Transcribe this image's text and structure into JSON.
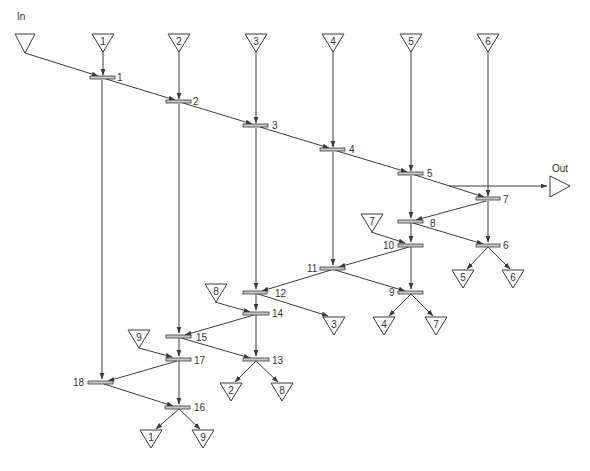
{
  "diagram": {
    "type": "sorting-network-flow",
    "input_label": "In",
    "output_label": "Out",
    "colors": {
      "line": "#3a3a3a",
      "bar_fill": "#c8c8c8",
      "background": "#ffffff"
    },
    "top_inputs": [
      {
        "id": "in",
        "label": "",
        "x": 23,
        "y": 34
      },
      {
        "id": "t1",
        "label": "1",
        "x": 103,
        "y": 34
      },
      {
        "id": "t2",
        "label": "2",
        "x": 179,
        "y": 34
      },
      {
        "id": "t3",
        "label": "3",
        "x": 256,
        "y": 34
      },
      {
        "id": "t4",
        "label": "4",
        "x": 333,
        "y": 34
      },
      {
        "id": "t5",
        "label": "5",
        "x": 411,
        "y": 34
      },
      {
        "id": "t6",
        "label": "6",
        "x": 488,
        "y": 34
      }
    ],
    "side_inputs": [
      {
        "id": "s7",
        "label": "7",
        "x": 372,
        "y": 218
      },
      {
        "id": "s8",
        "label": "8",
        "x": 216,
        "y": 289
      },
      {
        "id": "s9",
        "label": "9",
        "x": 139,
        "y": 335
      }
    ],
    "outputs": [
      {
        "id": "o5",
        "label": "5",
        "x": 463,
        "y": 278
      },
      {
        "id": "o6",
        "label": "6",
        "x": 513,
        "y": 278
      },
      {
        "id": "o3",
        "label": "3",
        "x": 334,
        "y": 322
      },
      {
        "id": "o4",
        "label": "4",
        "x": 384,
        "y": 325
      },
      {
        "id": "o7",
        "label": "7",
        "x": 436,
        "y": 325
      },
      {
        "id": "o2",
        "label": "2",
        "x": 231,
        "y": 391
      },
      {
        "id": "o8",
        "label": "8",
        "x": 282,
        "y": 391
      },
      {
        "id": "o1",
        "label": "1",
        "x": 151,
        "y": 438
      },
      {
        "id": "o9",
        "label": "9",
        "x": 203,
        "y": 438
      }
    ],
    "nodes": [
      {
        "id": "n1",
        "label": "1",
        "x": 102,
        "y": 78,
        "label_side": "right"
      },
      {
        "id": "n2",
        "label": "2",
        "x": 179,
        "y": 102,
        "label_side": "right"
      },
      {
        "id": "n3",
        "label": "3",
        "x": 256,
        "y": 126,
        "label_side": "right"
      },
      {
        "id": "n4",
        "label": "4",
        "x": 333,
        "y": 150,
        "label_side": "right"
      },
      {
        "id": "n5",
        "label": "5",
        "x": 411,
        "y": 174,
        "label_side": "right"
      },
      {
        "id": "n7",
        "label": "7",
        "x": 488,
        "y": 199,
        "label_side": "right"
      },
      {
        "id": "n8",
        "label": "8",
        "x": 411,
        "y": 221,
        "label_side": "right"
      },
      {
        "id": "n6",
        "label": "6",
        "x": 488,
        "y": 245,
        "label_side": "right"
      },
      {
        "id": "n10",
        "label": "10",
        "x": 411,
        "y": 245,
        "label_side": "left"
      },
      {
        "id": "n11",
        "label": "11",
        "x": 333,
        "y": 268,
        "label_side": "left"
      },
      {
        "id": "n9",
        "label": "9",
        "x": 411,
        "y": 292,
        "label_side": "left"
      },
      {
        "id": "n12",
        "label": "12",
        "x": 256,
        "y": 292,
        "label_side": "right"
      },
      {
        "id": "n14",
        "label": "14",
        "x": 256,
        "y": 313,
        "label_side": "right"
      },
      {
        "id": "n15",
        "label": "15",
        "x": 179,
        "y": 336,
        "label_side": "right"
      },
      {
        "id": "n17",
        "label": "17",
        "x": 179,
        "y": 359,
        "label_side": "right"
      },
      {
        "id": "n13",
        "label": "13",
        "x": 256,
        "y": 359,
        "label_side": "right"
      },
      {
        "id": "n18",
        "label": "18",
        "x": 102,
        "y": 382,
        "label_side": "left"
      },
      {
        "id": "n16",
        "label": "16",
        "x": 179,
        "y": 407,
        "label_side": "right"
      }
    ],
    "edges": [
      [
        "in",
        "n1"
      ],
      [
        "n1",
        "n2"
      ],
      [
        "n2",
        "n3"
      ],
      [
        "n3",
        "n4"
      ],
      [
        "n4",
        "n5"
      ],
      [
        "n5",
        "n7"
      ],
      [
        "t1",
        "n1"
      ],
      [
        "t2",
        "n2"
      ],
      [
        "t3",
        "n3"
      ],
      [
        "t4",
        "n4"
      ],
      [
        "t5",
        "n5"
      ],
      [
        "t6",
        "n7"
      ],
      [
        "n5-n7 line",
        "Out"
      ],
      [
        "n5",
        "n8"
      ],
      [
        "n7",
        "n8"
      ],
      [
        "n7",
        "n6"
      ],
      [
        "n8",
        "n6"
      ],
      [
        "n8",
        "n10"
      ],
      [
        "s7",
        "n10"
      ],
      [
        "n10",
        "n11"
      ],
      [
        "n10",
        "n9"
      ],
      [
        "n4",
        "n11"
      ],
      [
        "n11",
        "n9"
      ],
      [
        "n11",
        "n12"
      ],
      [
        "n6",
        "o5"
      ],
      [
        "n6",
        "o6"
      ],
      [
        "n9",
        "o4"
      ],
      [
        "n9",
        "o7"
      ],
      [
        "n3",
        "n12"
      ],
      [
        "n12",
        "n14"
      ],
      [
        "n12",
        "o3"
      ],
      [
        "s8",
        "n14"
      ],
      [
        "n14",
        "n15"
      ],
      [
        "n14",
        "n13"
      ],
      [
        "n2",
        "n15"
      ],
      [
        "n15",
        "n17"
      ],
      [
        "n15",
        "n13"
      ],
      [
        "s9",
        "n17"
      ],
      [
        "n13",
        "o2"
      ],
      [
        "n13",
        "o8"
      ],
      [
        "n17",
        "n18"
      ],
      [
        "n17",
        "n16"
      ],
      [
        "n1",
        "n18"
      ],
      [
        "n18",
        "n16"
      ],
      [
        "n16",
        "o1"
      ],
      [
        "n16",
        "o9"
      ]
    ]
  }
}
